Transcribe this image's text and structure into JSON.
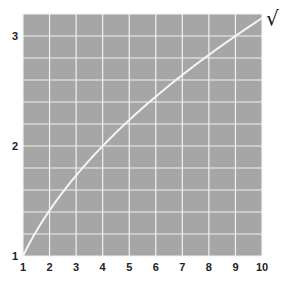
{
  "chart_data": {
    "type": "line",
    "title": "",
    "xlabel": "",
    "ylabel": "",
    "xlim": [
      1,
      10
    ],
    "ylim": [
      1,
      3.2
    ],
    "grid": true,
    "background_color": "#a6a6a6",
    "grid_color": "#f2f2f2",
    "line_color": "#f5f5f5",
    "x_ticks": [
      "1",
      "2",
      "3",
      "4",
      "5",
      "6",
      "7",
      "8",
      "9",
      "10"
    ],
    "y_ticks": [
      "1",
      "2",
      "3"
    ],
    "y_grid_step": 0.2,
    "series": [
      {
        "name": "y = √x",
        "function": "sqrt",
        "x": [
          1,
          1.5,
          2,
          2.5,
          3,
          3.5,
          4,
          5,
          6,
          7,
          8,
          9,
          10
        ],
        "values": [
          1.0,
          1.22,
          1.41,
          1.58,
          1.73,
          1.87,
          2.0,
          2.24,
          2.45,
          2.65,
          2.83,
          3.0,
          3.16
        ]
      }
    ],
    "annotations": [
      {
        "text": "√",
        "x": 10,
        "y": 3.16,
        "position": "right-end-of-curve"
      }
    ]
  }
}
